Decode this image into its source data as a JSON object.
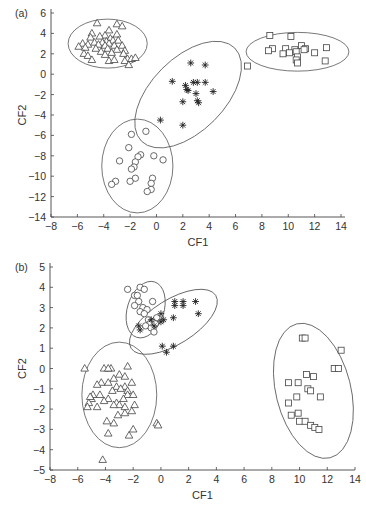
{
  "chart_data": [
    {
      "type": "scatter",
      "panel_label": "(a)",
      "xlabel": "CF1",
      "ylabel": "CF2",
      "xlim": [
        -8,
        15
      ],
      "ylim": [
        -14,
        6
      ],
      "xticks": [
        -8,
        -6,
        -4,
        -2,
        0,
        2,
        4,
        6,
        8,
        10,
        12,
        14
      ],
      "yticks": [
        6,
        4,
        2,
        0,
        -2,
        -4,
        -6,
        -8,
        -10,
        -12,
        -14
      ],
      "grid": false,
      "legend": "none",
      "series": [
        {
          "name": "triangles",
          "marker": "triangle",
          "points": [
            [
              -4.5,
              5.0
            ],
            [
              -3.0,
              4.9
            ],
            [
              -2.6,
              4.7
            ],
            [
              -3.6,
              4.3
            ],
            [
              -4.9,
              4.0
            ],
            [
              -3.9,
              3.8
            ],
            [
              -3.0,
              3.9
            ],
            [
              -5.0,
              3.6
            ],
            [
              -4.3,
              3.7
            ],
            [
              -3.5,
              3.5
            ],
            [
              -3.8,
              3.2
            ],
            [
              -3.3,
              3.3
            ],
            [
              -2.9,
              3.3
            ],
            [
              -4.7,
              3.1
            ],
            [
              -4.1,
              3.1
            ],
            [
              -3.6,
              3.0
            ],
            [
              -5.6,
              3.0
            ],
            [
              -5.2,
              2.9
            ],
            [
              -4.4,
              2.9
            ],
            [
              -3.9,
              2.8
            ],
            [
              -3.2,
              2.8
            ],
            [
              -2.6,
              2.8
            ],
            [
              -5.9,
              2.7
            ],
            [
              -5.4,
              2.6
            ],
            [
              -4.6,
              2.5
            ],
            [
              -3.7,
              2.5
            ],
            [
              -3.0,
              2.4
            ],
            [
              -2.4,
              2.3
            ],
            [
              -4.2,
              2.2
            ],
            [
              -3.4,
              2.1
            ],
            [
              -2.5,
              2.0
            ],
            [
              -5.5,
              2.0
            ],
            [
              -5.2,
              1.8
            ],
            [
              -3.9,
              1.9
            ],
            [
              -4.9,
              1.4
            ],
            [
              -3.6,
              1.3
            ],
            [
              -3.2,
              1.4
            ],
            [
              -2.2,
              1.5
            ],
            [
              -1.9,
              1.5
            ],
            [
              -1.6,
              1.6
            ],
            [
              -2.4,
              1.3
            ],
            [
              -2.1,
              0.9
            ]
          ]
        },
        {
          "name": "stars",
          "marker": "asterisk",
          "points": [
            [
              2.6,
              1.1
            ],
            [
              3.7,
              0.9
            ],
            [
              1.2,
              -0.7
            ],
            [
              2.8,
              -0.8
            ],
            [
              3.1,
              -0.8
            ],
            [
              3.7,
              -0.8
            ],
            [
              2.2,
              -1.1
            ],
            [
              2.3,
              -1.5
            ],
            [
              2.4,
              -1.6
            ],
            [
              3.0,
              -1.9
            ],
            [
              4.3,
              -1.7
            ],
            [
              2.0,
              -2.7
            ],
            [
              3.1,
              -2.6
            ],
            [
              3.2,
              -2.8
            ],
            [
              0.3,
              -4.5
            ],
            [
              2.0,
              -5.0
            ]
          ]
        },
        {
          "name": "squares",
          "marker": "square",
          "points": [
            [
              8.6,
              3.8
            ],
            [
              10.2,
              3.7
            ],
            [
              8.8,
              2.5
            ],
            [
              8.5,
              2.3
            ],
            [
              9.8,
              2.5
            ],
            [
              10.5,
              2.4
            ],
            [
              11.0,
              2.8
            ],
            [
              11.3,
              2.5
            ],
            [
              10.6,
              2.2
            ],
            [
              11.2,
              2.4
            ],
            [
              12.9,
              2.6
            ],
            [
              9.6,
              2.0
            ],
            [
              10.1,
              2.1
            ],
            [
              10.7,
              1.7
            ],
            [
              12.0,
              2.1
            ],
            [
              10.6,
              1.4
            ],
            [
              10.7,
              1.1
            ],
            [
              12.8,
              1.3
            ],
            [
              6.9,
              0.8
            ]
          ]
        },
        {
          "name": "circles",
          "marker": "circle",
          "points": [
            [
              -1.9,
              -5.9
            ],
            [
              -0.8,
              -5.6
            ],
            [
              -2.1,
              -7.2
            ],
            [
              -1.2,
              -7.9
            ],
            [
              -1.4,
              -8.1
            ],
            [
              -1.6,
              -8.6
            ],
            [
              -0.2,
              -8.0
            ],
            [
              0.5,
              -8.4
            ],
            [
              -2.8,
              -8.5
            ],
            [
              -1.7,
              -9.1
            ],
            [
              -1.9,
              -9.3
            ],
            [
              -1.6,
              -10.2
            ],
            [
              -2.0,
              -10.5
            ],
            [
              -0.3,
              -10.2
            ],
            [
              -0.4,
              -10.7
            ],
            [
              -3.1,
              -10.5
            ],
            [
              -3.4,
              -10.8
            ],
            [
              -0.4,
              -11.3
            ],
            [
              -0.7,
              -11.5
            ]
          ]
        }
      ],
      "ellipses": [
        {
          "cx": -3.7,
          "cy": 3.0,
          "rx": 3.0,
          "ry": 2.4,
          "angle": 0
        },
        {
          "cx": 2.4,
          "cy": -2.0,
          "rx": 5.0,
          "ry": 3.6,
          "angle": -45
        },
        {
          "cx": 10.7,
          "cy": 2.2,
          "rx": 3.9,
          "ry": 1.9,
          "angle": 0
        },
        {
          "cx": -1.45,
          "cy": -9.0,
          "rx": 2.7,
          "ry": 4.6,
          "angle": 0
        }
      ]
    },
    {
      "type": "scatter",
      "panel_label": "(b)",
      "xlabel": "CF1",
      "ylabel": "CF2",
      "xlim": [
        -8,
        14
      ],
      "ylim": [
        -5,
        5
      ],
      "xticks": [
        -8,
        -6,
        -4,
        -2,
        0,
        2,
        4,
        6,
        8,
        10,
        12,
        14
      ],
      "yticks": [
        5,
        4,
        3,
        2,
        1,
        0,
        -1,
        -2,
        -3,
        -4,
        -5
      ],
      "grid": false,
      "legend": "none",
      "series": [
        {
          "name": "circles",
          "marker": "circle",
          "points": [
            [
              -2.4,
              3.9
            ],
            [
              -1.5,
              4.0
            ],
            [
              -1.2,
              3.9
            ],
            [
              -1.9,
              3.6
            ],
            [
              -1.7,
              3.6
            ],
            [
              -1.6,
              3.3
            ],
            [
              -0.6,
              3.3
            ],
            [
              -1.9,
              3.1
            ],
            [
              -1.3,
              3.0
            ],
            [
              -1.5,
              2.8
            ],
            [
              -1.0,
              2.9
            ],
            [
              -1.2,
              2.7
            ],
            [
              -0.9,
              2.4
            ],
            [
              -0.3,
              2.5
            ],
            [
              -0.6,
              2.3
            ],
            [
              -0.8,
              2.2
            ],
            [
              -0.4,
              2.2
            ],
            [
              -1.1,
              2.1
            ],
            [
              -0.7,
              2.0
            ],
            [
              -0.5,
              1.8
            ]
          ]
        },
        {
          "name": "stars",
          "marker": "asterisk",
          "points": [
            [
              1.0,
              3.3
            ],
            [
              1.0,
              3.1
            ],
            [
              1.6,
              3.3
            ],
            [
              1.6,
              3.1
            ],
            [
              2.5,
              3.3
            ],
            [
              2.7,
              2.7
            ],
            [
              0.0,
              2.7
            ],
            [
              0.9,
              2.5
            ],
            [
              -0.7,
              2.4
            ],
            [
              0.0,
              2.3
            ],
            [
              0.2,
              2.4
            ],
            [
              -1.6,
              2.1
            ],
            [
              -1.5,
              1.9
            ],
            [
              -0.5,
              2.1
            ],
            [
              0.1,
              1.1
            ],
            [
              0.9,
              1.1
            ],
            [
              0.4,
              0.8
            ]
          ]
        },
        {
          "name": "triangles",
          "marker": "triangle",
          "points": [
            [
              -5.5,
              0.0
            ],
            [
              -4.1,
              0.0
            ],
            [
              -3.6,
              0.0
            ],
            [
              -3.8,
              0.0
            ],
            [
              -2.4,
              0.1
            ],
            [
              -3.0,
              -0.3
            ],
            [
              -2.6,
              -0.4
            ],
            [
              -3.4,
              -0.5
            ],
            [
              -4.3,
              -0.7
            ],
            [
              -3.8,
              -0.7
            ],
            [
              -2.1,
              -0.7
            ],
            [
              -4.6,
              -0.8
            ],
            [
              -3.2,
              -0.9
            ],
            [
              -2.6,
              -0.9
            ],
            [
              -2.9,
              -1.0
            ],
            [
              -3.5,
              -1.1
            ],
            [
              -2.4,
              -1.1
            ],
            [
              -4.9,
              -1.3
            ],
            [
              -4.4,
              -1.3
            ],
            [
              -2.4,
              -1.3
            ],
            [
              -2.0,
              -1.3
            ],
            [
              -5.0,
              -1.5
            ],
            [
              -3.8,
              -1.5
            ],
            [
              -2.7,
              -1.5
            ],
            [
              -5.2,
              -1.7
            ],
            [
              -4.1,
              -1.6
            ],
            [
              -3.2,
              -1.7
            ],
            [
              -3.0,
              -1.8
            ],
            [
              -2.6,
              -1.9
            ],
            [
              -5.3,
              -1.9
            ],
            [
              -4.6,
              -1.9
            ],
            [
              -3.4,
              -1.8
            ],
            [
              -1.9,
              -1.8
            ],
            [
              -2.6,
              -2.2
            ],
            [
              -2.1,
              -2.1
            ],
            [
              -3.1,
              -2.3
            ],
            [
              -3.9,
              -2.6
            ],
            [
              -3.4,
              -2.7
            ],
            [
              -2.0,
              -3.0
            ],
            [
              -0.3,
              -2.7
            ],
            [
              -0.2,
              -2.8
            ],
            [
              -3.8,
              -3.2
            ],
            [
              -2.3,
              -3.3
            ],
            [
              -4.2,
              -4.5
            ],
            [
              -5.1,
              -1.4
            ]
          ]
        },
        {
          "name": "squares",
          "marker": "square",
          "points": [
            [
              10.2,
              1.5
            ],
            [
              10.4,
              1.5
            ],
            [
              13.0,
              0.9
            ],
            [
              12.5,
              0.0
            ],
            [
              12.8,
              0.0
            ],
            [
              10.5,
              -0.3
            ],
            [
              11.0,
              -0.4
            ],
            [
              9.2,
              -0.7
            ],
            [
              9.9,
              -0.7
            ],
            [
              10.6,
              -1.0
            ],
            [
              10.8,
              -1.1
            ],
            [
              11.5,
              -1.4
            ],
            [
              9.8,
              -1.4
            ],
            [
              9.2,
              -1.7
            ],
            [
              9.4,
              -2.3
            ],
            [
              9.9,
              -2.2
            ],
            [
              10.0,
              -2.6
            ],
            [
              10.4,
              -2.6
            ],
            [
              10.8,
              -2.8
            ],
            [
              11.1,
              -2.9
            ],
            [
              11.4,
              -3.0
            ]
          ]
        }
      ],
      "ellipses": [
        {
          "cx": -1.1,
          "cy": 2.9,
          "rx": 2.1,
          "ry": 0.9,
          "angle": -72
        },
        {
          "cx": 0.9,
          "cy": 2.3,
          "rx": 3.6,
          "ry": 1.1,
          "angle": -32
        },
        {
          "cx": -3.0,
          "cy": -1.3,
          "rx": 2.7,
          "ry": 2.6,
          "angle": 0
        },
        {
          "cx": 11.0,
          "cy": -1.1,
          "rx": 2.7,
          "ry": 3.4,
          "angle": -14
        }
      ]
    }
  ],
  "layout": {
    "panels": [
      {
        "x0": 51,
        "x1": 341,
        "xmin": -8,
        "xmax": 14,
        "y0": 13,
        "y1": 217,
        "ymax": 6,
        "ymin": -14,
        "axis_right": 345
      },
      {
        "x0": 50,
        "x1": 355,
        "xmin": -8,
        "xmax": 14,
        "y0": 267,
        "y1": 470,
        "ymax": 5,
        "ymin": -5,
        "axis_right": 355
      }
    ]
  }
}
